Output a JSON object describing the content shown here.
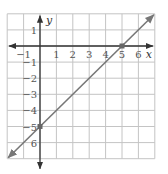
{
  "chart_data": {
    "type": "line",
    "title": "",
    "xlabel": "x",
    "ylabel": "y",
    "xlim": [
      -2,
      7
    ],
    "ylim": [
      -7,
      2
    ],
    "grid": true,
    "x_ticks": [
      -1,
      1,
      2,
      3,
      4,
      5,
      6
    ],
    "y_ticks": [
      1,
      -1,
      -2,
      -3,
      -4,
      -5,
      -6
    ],
    "x_tick_labels": [
      "−1",
      "1",
      "2",
      "3",
      "4",
      "5",
      "6"
    ],
    "y_tick_labels": [
      "1",
      "−1",
      "−2",
      "−3",
      "−4",
      "−5",
      "6"
    ],
    "series": [
      {
        "name": "line",
        "equation": "y = x - 5",
        "x": [
          -2,
          7
        ],
        "y": [
          -7,
          2
        ],
        "arrows": "both",
        "color": "#777777"
      }
    ],
    "points": [
      {
        "x": 5,
        "y": 0,
        "label": "x-intercept"
      },
      {
        "x": 0,
        "y": -5,
        "label": "y-intercept"
      }
    ],
    "colors": {
      "grid": "#c4c4c4",
      "axis": "#333333",
      "line": "#777777",
      "point": "#666666"
    }
  }
}
